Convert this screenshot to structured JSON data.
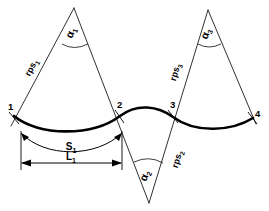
{
  "figure": {
    "background_color": "#ffffff",
    "line_color": "#000000",
    "curve_color": "#000000"
  },
  "nodes": [
    {
      "id": "n1",
      "label": "1",
      "x": 14,
      "y": 116
    },
    {
      "id": "n2",
      "label": "2",
      "x": 120,
      "y": 116
    },
    {
      "id": "n3",
      "label": "3",
      "x": 173,
      "y": 116
    },
    {
      "id": "n4",
      "label": "4",
      "x": 253,
      "y": 118
    }
  ],
  "sectors": [
    {
      "id": "sector-1",
      "angle_label": "α",
      "angle_subscript": "1",
      "side_label": "rps",
      "side_subscript": "1",
      "apex_x": 74,
      "apex_y": 8,
      "orientation": "up"
    },
    {
      "id": "sector-2",
      "angle_label": "α",
      "angle_subscript": "2",
      "side_label": "rps",
      "side_subscript": "2",
      "apex_x": 149,
      "apex_y": 203,
      "orientation": "down"
    },
    {
      "id": "sector-3",
      "angle_label": "α",
      "angle_subscript": "3",
      "side_label": "rps",
      "side_subscript": "3",
      "apex_x": 208,
      "apex_y": 10,
      "orientation": "up"
    }
  ],
  "dimensions": [
    {
      "id": "dim-arc",
      "label": "S",
      "subscript": "1",
      "kind": "arc-length",
      "from_node": "1",
      "to_node": "2"
    },
    {
      "id": "dim-chord",
      "label": "L",
      "subscript": "1",
      "kind": "chord-length",
      "from_node": "1",
      "to_node": "2"
    }
  ],
  "icons": {
    "arrowhead": "arrowhead-icon",
    "angle_arc": "angle-arc-icon"
  }
}
